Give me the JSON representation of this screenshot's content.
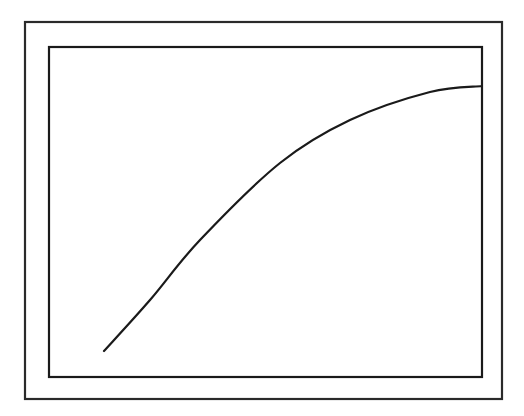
{
  "figure": {
    "outer_frame": {
      "x": 25,
      "y": 22,
      "w": 477,
      "h": 377
    },
    "inner_frame": {
      "x": 49,
      "y": 47,
      "w": 433,
      "h": 330
    },
    "curve": {
      "description": "concave-down increasing curve",
      "points": [
        [
          104,
          351
        ],
        [
          150,
          300
        ],
        [
          200,
          240
        ],
        [
          280,
          163
        ],
        [
          350,
          120
        ],
        [
          430,
          92
        ],
        [
          482,
          86
        ]
      ]
    },
    "colors": {
      "stroke": "#1a1a1a",
      "frame": "#2a2a2a",
      "background": "#ffffff"
    }
  }
}
